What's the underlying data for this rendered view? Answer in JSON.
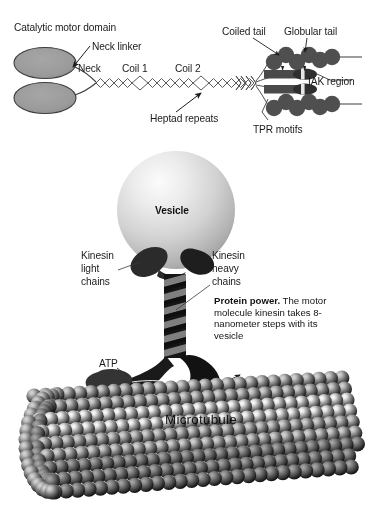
{
  "figure": {
    "title_caption": {
      "lead": "Protein power.",
      "body": " The motor molecule kinesin takes 8-nanometer steps with its vesicle"
    },
    "top_panel": {
      "labels": [
        {
          "id": "catalytic-motor-domain",
          "text": "Catalytic motor domain",
          "x": 14,
          "y": 22
        },
        {
          "id": "neck-linker",
          "text": "Neck linker",
          "x": 92,
          "y": 41
        },
        {
          "id": "neck",
          "text": "Neck",
          "x": 78,
          "y": 67
        },
        {
          "id": "coil-1",
          "text": "Coil 1",
          "x": 122,
          "y": 67
        },
        {
          "id": "coil-2",
          "text": "Coil 2",
          "x": 175,
          "y": 67
        },
        {
          "id": "coiled-tail",
          "text": "Coiled tail",
          "x": 224,
          "y": 29
        },
        {
          "id": "globular-tail",
          "text": "Globular tail",
          "x": 287,
          "y": 29
        },
        {
          "id": "iak-region",
          "text": "IAK region",
          "x": 310,
          "y": 84
        },
        {
          "id": "heptad-repeats",
          "text": "Heptad repeats",
          "x": 153,
          "y": 116
        },
        {
          "id": "tpr-motifs",
          "text": "TPR motifs",
          "x": 253,
          "y": 127
        }
      ]
    },
    "bottom_panel": {
      "labels": [
        {
          "id": "vesicle",
          "text": "Vesicle",
          "x": 151,
          "y": 215
        },
        {
          "id": "kinesin-light-chains-1",
          "text": "Kinesin",
          "x": 83,
          "y": 255
        },
        {
          "id": "kinesin-light-chains-2",
          "text": "light",
          "x": 83,
          "y": 267
        },
        {
          "id": "kinesin-light-chains-3",
          "text": "chains",
          "x": 83,
          "y": 279
        },
        {
          "id": "kinesin-heavy-chains-1",
          "text": "Kinesin",
          "x": 212,
          "y": 255
        },
        {
          "id": "kinesin-heavy-chains-2",
          "text": "heavy",
          "x": 212,
          "y": 267
        },
        {
          "id": "kinesin-heavy-chains-3",
          "text": "chains",
          "x": 212,
          "y": 279
        },
        {
          "id": "atp",
          "text": "ATP",
          "x": 100,
          "y": 363
        },
        {
          "id": "microtubule",
          "text": "Microtubule",
          "x": 165,
          "y": 415
        }
      ]
    },
    "colors": {
      "motor_domain_fill": "#9a9a9a",
      "outline": "#3a3a3a",
      "tail_blob": "#4a4a4a",
      "vesicle_light": "#f2f2f2",
      "vesicle_dark": "#a8a8a8",
      "stalk_dark": "#121212",
      "stalk_gray": "#7d7d7d",
      "microtubule_light": "#e8e8e8",
      "microtubule_dark": "#2a2a2a",
      "text": "#1b1b1b",
      "background": "#ffffff"
    }
  }
}
